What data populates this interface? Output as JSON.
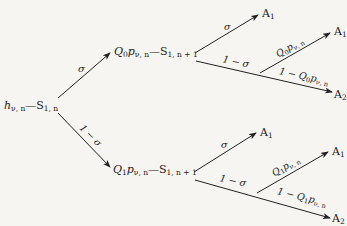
{
  "diagram": {
    "type": "probability-tree",
    "root": {
      "h": "h",
      "h_sub": "ν, n",
      "s": "S",
      "s_sub": "1, n"
    },
    "branches": {
      "upper_edge_label": "σ",
      "lower_edge_label": "1 − σ"
    },
    "upper_node": {
      "q": "Q",
      "q_sub": "0",
      "p": "p",
      "p_sub": "ν, n",
      "s": "S",
      "s_sub": "1, n + 1"
    },
    "lower_node": {
      "q": "Q",
      "q_sub": "1",
      "p": "p",
      "p_sub": "ν, n",
      "s": "S",
      "s_sub": "1, n + 1"
    },
    "upper_sub": {
      "sigma_label": "σ",
      "sigma_target": "A",
      "sigma_target_sub": "1",
      "one_minus_sigma_label": "1 − σ",
      "up_label_q": "Q",
      "up_label_q_sub": "0",
      "up_label_p": "p",
      "up_label_p_sub": "ν, n",
      "up_target": "A",
      "up_target_sub": "1",
      "down_label_prefix": "1 − ",
      "down_label_q": "Q",
      "down_label_q_sub": "0",
      "down_label_p": "p",
      "down_label_p_sub": "ν, n",
      "down_target": "A",
      "down_target_sub": "2"
    },
    "lower_sub": {
      "sigma_label": "σ",
      "sigma_target": "A",
      "sigma_target_sub": "1",
      "one_minus_sigma_label": "1 − σ",
      "up_label_q": "Q",
      "up_label_q_sub": "1",
      "up_label_p": "p",
      "up_label_p_sub": "ν, n",
      "up_target": "A",
      "up_target_sub": "1",
      "down_label_prefix": "1 − ",
      "down_label_q": "Q",
      "down_label_q_sub": "1",
      "down_label_p": "p",
      "down_label_p_sub": "ν, n",
      "down_target": "A",
      "down_target_sub": "2"
    },
    "line_color": "#222222",
    "background": "#f6f5f2"
  }
}
